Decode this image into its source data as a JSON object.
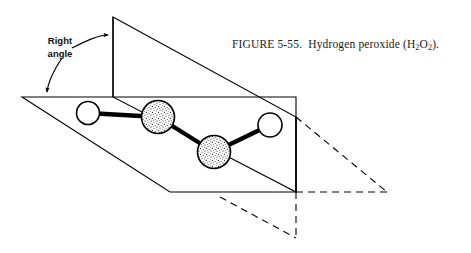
{
  "figure": {
    "caption": {
      "number_label": "FIGURE 5-55.",
      "title": "Hydrogen peroxide (H",
      "sub1": "2",
      "mid": "O",
      "sub2": "2",
      "tail": ").",
      "full_text": "FIGURE 5-55.  Hydrogen peroxide (H2O2)."
    },
    "annotation": {
      "line1": "Right",
      "line2": "angle"
    },
    "colors": {
      "ink": "#000000",
      "paper": "#ffffff",
      "atom_fill_hydrogen": "#ffffff",
      "atom_fill_oxygen_stipple": "#9a9a9a"
    },
    "molecule": {
      "name": "Hydrogen peroxide",
      "formula": "H2O2",
      "atoms": [
        {
          "id": "H-left",
          "element": "H",
          "cx": 88,
          "cy": 113,
          "r": 11.5,
          "style": "open"
        },
        {
          "id": "O-left",
          "element": "O",
          "cx": 158,
          "cy": 117,
          "r": 16.5,
          "style": "stippled"
        },
        {
          "id": "O-right",
          "element": "O",
          "cx": 214,
          "cy": 152,
          "r": 16.5,
          "style": "stippled"
        },
        {
          "id": "H-right",
          "element": "H",
          "cx": 270,
          "cy": 125,
          "r": 12.0,
          "style": "open"
        }
      ],
      "bonds": [
        {
          "from": "H-left",
          "to": "O-left"
        },
        {
          "from": "O-left",
          "to": "O-right"
        },
        {
          "from": "O-right",
          "to": "H-right"
        }
      ]
    },
    "planes": {
      "horizontal_plane": {
        "style": "solid",
        "points": "22,97 296,97 296,192 170,192"
      },
      "vertical_plane": {
        "style": "solid",
        "points": "113,17 296,117 296,192 113,97"
      },
      "dashed_plane_upper": {
        "style": "dashed",
        "points": "296,117 387,192 296,192"
      },
      "dashed_plane_lower": {
        "style": "dashed",
        "points": "220,197 296,238 296,192"
      }
    }
  }
}
